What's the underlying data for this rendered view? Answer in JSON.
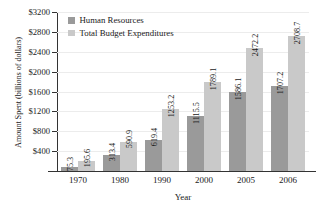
{
  "chart_data": {
    "type": "bar",
    "title": "",
    "xlabel": "Year",
    "ylabel": "Amount Spent (billions of dollars)",
    "categories": [
      "1970",
      "1980",
      "1990",
      "2000",
      "2005",
      "2006"
    ],
    "series": [
      {
        "name": "Human Resources",
        "color": "#9a9a9a",
        "values": [
          75.3,
          313.4,
          619.4,
          1115.5,
          1586.1,
          1707.2
        ],
        "labels": [
          "75.3",
          "313.4",
          "619.4",
          "1115.5",
          "1586.1",
          "1707.2"
        ]
      },
      {
        "name": "Total Budget Expenditures",
        "color": "#c9c9c9",
        "values": [
          195.6,
          590.9,
          1253.2,
          1789.1,
          2472.2,
          2708.7
        ],
        "labels": [
          "195.6",
          "590.9",
          "1253.2",
          "1789.1",
          "2472.2",
          "2708.7"
        ]
      }
    ],
    "ylim": [
      0,
      3200
    ],
    "yticks": [
      400,
      800,
      1200,
      1600,
      2000,
      2400,
      2800,
      3200
    ],
    "ytick_labels": [
      "$400",
      "$800",
      "$1200",
      "$1600",
      "$2000",
      "$2400",
      "$2800",
      "$3200"
    ],
    "grid": true,
    "legend_position": "top-left"
  }
}
